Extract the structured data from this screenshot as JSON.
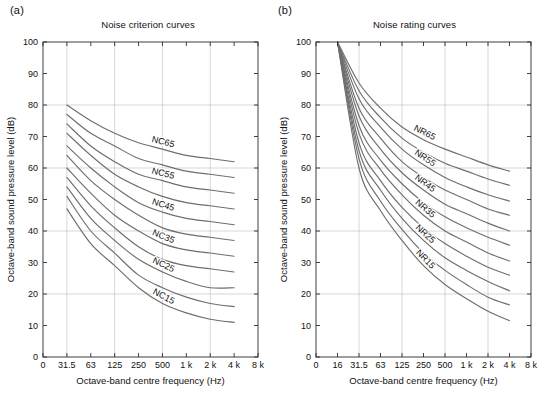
{
  "figure": {
    "width": 545,
    "height": 405,
    "background": "#ffffff",
    "curve_color": "#6e6e6e",
    "axis_color": "#2b2b2b",
    "grid_color": "#bdbdbd"
  },
  "panels": [
    {
      "tag": "(a)",
      "title": "Noise criterion curves",
      "xlabel": "Octave-band centre frequency (Hz)",
      "ylabel": "Octave-band sound pressure level (dB)"
    },
    {
      "tag": "(b)",
      "title": "Noise rating curves",
      "xlabel": "Octave-band centre frequency (Hz)",
      "ylabel": "Octave-band sound pressure level (dB)"
    }
  ],
  "chart_data": [
    {
      "type": "line",
      "panel": "a",
      "title": "Noise criterion curves",
      "xlabel": "Octave-band centre frequency (Hz)",
      "ylabel": "Octave-band sound pressure level (dB)",
      "xtick_labels": [
        "0",
        "31.5",
        "63",
        "125",
        "250",
        "500",
        "1 k",
        "2 k",
        "4 k",
        "8 k"
      ],
      "x_categories": [
        31.5,
        63,
        125,
        250,
        500,
        1000,
        2000,
        4000,
        8000
      ],
      "ytick_labels": [
        "0",
        "10",
        "20",
        "30",
        "40",
        "50",
        "60",
        "70",
        "80",
        "90",
        "100"
      ],
      "ylim": [
        0,
        100
      ],
      "grid": true,
      "grid_y_at": [
        20,
        40,
        60,
        80
      ],
      "grid_x_at": [
        "31.5",
        "125",
        "500",
        "2 k"
      ],
      "legend": "inline-curve-labels",
      "labelled_curves": [
        "NC65",
        "NC55",
        "NC45",
        "NC35",
        "NC25",
        "NC15"
      ],
      "series": [
        {
          "name": "NC65",
          "label": "NC65",
          "labelled": true,
          "values": [
            null,
            80.0,
            75.0,
            71.0,
            68.0,
            66.0,
            64.0,
            63.0,
            62.0
          ]
        },
        {
          "name": "NC60",
          "label": "NC60",
          "labelled": false,
          "values": [
            null,
            77.0,
            71.0,
            67.0,
            63.0,
            61.0,
            59.0,
            58.0,
            57.0
          ]
        },
        {
          "name": "NC55",
          "label": "NC55",
          "labelled": true,
          "values": [
            null,
            74.0,
            67.0,
            62.0,
            58.0,
            56.0,
            54.0,
            53.0,
            52.0
          ]
        },
        {
          "name": "NC50",
          "label": "NC50",
          "labelled": false,
          "values": [
            null,
            71.0,
            64.0,
            58.0,
            54.0,
            51.0,
            49.0,
            48.0,
            47.0
          ]
        },
        {
          "name": "NC45",
          "label": "NC45",
          "labelled": true,
          "values": [
            null,
            67.0,
            60.0,
            54.0,
            49.0,
            46.0,
            44.0,
            43.0,
            42.0
          ]
        },
        {
          "name": "NC40",
          "label": "NC40",
          "labelled": false,
          "values": [
            null,
            64.0,
            56.0,
            50.0,
            45.0,
            41.0,
            39.0,
            38.0,
            37.0
          ]
        },
        {
          "name": "NC35",
          "label": "NC35",
          "labelled": true,
          "values": [
            null,
            60.0,
            52.0,
            45.0,
            40.0,
            36.0,
            34.0,
            33.0,
            32.0
          ]
        },
        {
          "name": "NC30",
          "label": "NC30",
          "labelled": false,
          "values": [
            null,
            57.0,
            48.0,
            41.0,
            35.0,
            31.0,
            29.0,
            28.0,
            27.0
          ]
        },
        {
          "name": "NC25",
          "label": "NC25",
          "labelled": true,
          "values": [
            null,
            54.0,
            44.0,
            37.0,
            31.0,
            27.0,
            24.0,
            22.0,
            22.0
          ]
        },
        {
          "name": "NC20",
          "label": "NC20",
          "labelled": false,
          "values": [
            null,
            51.0,
            40.0,
            33.0,
            26.0,
            22.0,
            19.0,
            17.0,
            16.0
          ]
        },
        {
          "name": "NC15",
          "label": "NC15",
          "labelled": true,
          "values": [
            null,
            47.0,
            36.0,
            29.0,
            22.0,
            17.0,
            14.0,
            12.0,
            11.0
          ]
        }
      ]
    },
    {
      "type": "line",
      "panel": "b",
      "title": "Noise rating curves",
      "xlabel": "Octave-band centre frequency (Hz)",
      "ylabel": "Octave-band sound pressure level (dB)",
      "xtick_labels": [
        "0",
        "16",
        "31.5",
        "63",
        "125",
        "250",
        "500",
        "1 k",
        "2 k",
        "4 k",
        "8 k"
      ],
      "x_categories": [
        16,
        31.5,
        63,
        125,
        250,
        500,
        1000,
        2000,
        4000,
        8000
      ],
      "ytick_labels": [
        "0",
        "10",
        "20",
        "30",
        "40",
        "50",
        "60",
        "70",
        "80",
        "90",
        "100"
      ],
      "ylim": [
        0,
        100
      ],
      "grid": true,
      "grid_y_at": [
        20,
        40,
        60,
        80
      ],
      "grid_x_at": [
        "31.5",
        "125",
        "500",
        "2 k"
      ],
      "legend": "inline-curve-labels",
      "labelled_curves": [
        "NR65",
        "NR55",
        "NR45",
        "NR35",
        "NR25",
        "NR15"
      ],
      "series": [
        {
          "name": "NR65",
          "label": "NR65",
          "labelled": true,
          "values": [
            null,
            100.0,
            87.0,
            79.0,
            73.0,
            69.0,
            66.0,
            63.5,
            61.0,
            59.0
          ]
        },
        {
          "name": "NR60",
          "label": "NR60",
          "labelled": false,
          "values": [
            null,
            100.0,
            84.5,
            76.0,
            69.5,
            65.0,
            61.5,
            59.0,
            56.5,
            54.5
          ]
        },
        {
          "name": "NR55",
          "label": "NR55",
          "labelled": true,
          "values": [
            null,
            100.0,
            82.0,
            73.0,
            66.0,
            61.0,
            57.0,
            54.0,
            51.5,
            49.5
          ]
        },
        {
          "name": "NR50",
          "label": "NR50",
          "labelled": false,
          "values": [
            null,
            100.0,
            79.0,
            69.5,
            62.0,
            57.0,
            53.0,
            50.0,
            47.0,
            45.0
          ]
        },
        {
          "name": "NR45",
          "label": "NR45",
          "labelled": true,
          "values": [
            null,
            100.0,
            76.5,
            66.0,
            58.5,
            53.0,
            48.5,
            45.5,
            42.5,
            40.0
          ]
        },
        {
          "name": "NR40",
          "label": "NR40",
          "labelled": false,
          "values": [
            null,
            100.0,
            73.5,
            62.5,
            55.0,
            49.0,
            44.5,
            41.0,
            38.0,
            35.5
          ]
        },
        {
          "name": "NR35",
          "label": "NR35",
          "labelled": true,
          "values": [
            null,
            100.0,
            71.0,
            59.5,
            51.5,
            45.0,
            40.0,
            36.5,
            33.0,
            30.5
          ]
        },
        {
          "name": "NR30",
          "label": "NR30",
          "labelled": false,
          "values": [
            null,
            100.0,
            68.0,
            56.0,
            47.5,
            41.0,
            36.0,
            32.0,
            28.5,
            26.0
          ]
        },
        {
          "name": "NR25",
          "label": "NR25",
          "labelled": true,
          "values": [
            null,
            100.0,
            65.5,
            53.0,
            44.0,
            37.0,
            31.5,
            27.5,
            24.0,
            21.0
          ]
        },
        {
          "name": "NR20",
          "label": "NR20",
          "labelled": false,
          "values": [
            null,
            100.0,
            63.0,
            49.5,
            40.5,
            33.0,
            27.5,
            23.0,
            19.0,
            16.5
          ]
        },
        {
          "name": "NR15",
          "label": "NR15",
          "labelled": true,
          "values": [
            null,
            100.0,
            60.0,
            46.5,
            37.0,
            29.0,
            23.0,
            18.5,
            14.5,
            11.5
          ]
        }
      ]
    }
  ]
}
